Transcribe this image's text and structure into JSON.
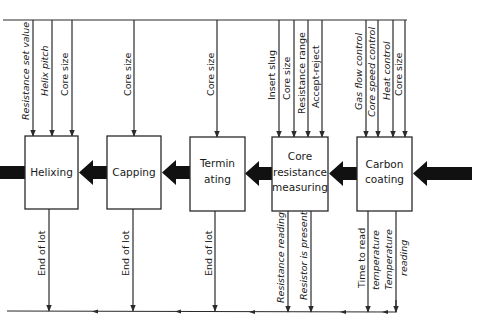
{
  "diagram": {
    "type": "process-flow",
    "direction": "right-to-left",
    "stages": [
      {
        "id": "helixing",
        "label_lines": [
          "Helixing"
        ],
        "inputs": [
          "Resistance set value",
          "Helix pitch",
          "Core size"
        ],
        "outputs": [
          "End of lot"
        ]
      },
      {
        "id": "capping",
        "label_lines": [
          "Capping"
        ],
        "inputs": [
          "Core size"
        ],
        "outputs": [
          "End of lot"
        ]
      },
      {
        "id": "terminating",
        "label_lines": [
          "Termin",
          "ating"
        ],
        "inputs": [
          "Core size"
        ],
        "outputs": [
          "End of lot"
        ]
      },
      {
        "id": "core-resistance-measuring",
        "label_lines": [
          "Core",
          "resistance",
          "measuring"
        ],
        "inputs": [
          "Insert slug",
          "Core size",
          "Resistance range",
          "Accept-reject"
        ],
        "outputs": [
          "Resistance reading",
          "Resistor is present"
        ]
      },
      {
        "id": "carbon-coating",
        "label_lines": [
          "Carbon",
          "coating"
        ],
        "inputs": [
          "Gas flow control",
          "Core speed control",
          "Heat control",
          "Core size"
        ],
        "outputs": [
          "Time to read temperature",
          "Temperature reading"
        ]
      }
    ],
    "output_label_lines": {
      "time_to_read": [
        "Time to read",
        "temperature"
      ],
      "temperature_reading": [
        "Temperature",
        "reading"
      ]
    }
  }
}
